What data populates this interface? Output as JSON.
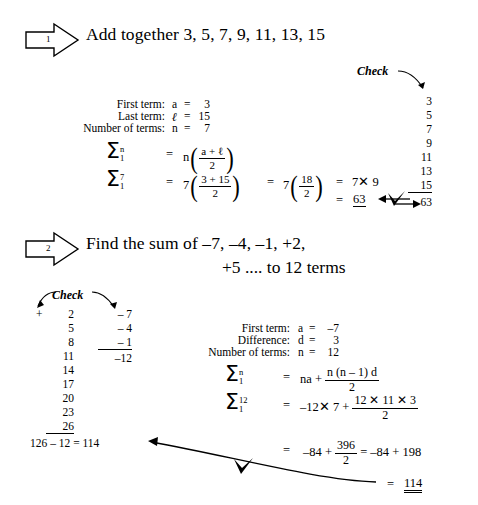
{
  "document": {
    "type": "worksheet",
    "subject": "Arithmetic progressions - sum of series"
  },
  "problems": [
    {
      "number": "1",
      "title": "Add together 3, 5, 7, 9, 11, 13, 15",
      "given": [
        {
          "label": "First term:",
          "symbol": "a",
          "eq": "=",
          "value": "3"
        },
        {
          "label": "Last term:",
          "symbol": "ℓ",
          "eq": "=",
          "value": "15"
        },
        {
          "label": "Number of terms:",
          "symbol": "n",
          "eq": "=",
          "value": "7"
        }
      ],
      "formula": {
        "sigma": "Σ",
        "upper_general": "n",
        "lower_general": "1",
        "upper_value": "7",
        "lower_value": "1",
        "general_lead": "n",
        "general_num": "a + ℓ",
        "general_den": "2",
        "sub_lead": "7",
        "sub_num": "3 + 15",
        "sub_den": "2",
        "step2_lead": "7",
        "step2_num": "18",
        "step2_den": "2",
        "step3": "7✕ 9",
        "equals": "=",
        "answer": "63"
      },
      "check": {
        "label": "Check",
        "terms": [
          "3",
          "5",
          "7",
          "9",
          "11",
          "13",
          "15"
        ],
        "total": "63"
      }
    },
    {
      "number": "2",
      "title": "Find the sum of –7, –4, –1, +2,",
      "title_cont": "+5 .... to 12 terms",
      "given": [
        {
          "label": "First term:",
          "symbol": "a",
          "eq": "=",
          "value": "–7"
        },
        {
          "label": "Difference:",
          "symbol": "d",
          "eq": "=",
          "value": "3"
        },
        {
          "label": "Number of terms:",
          "symbol": "n",
          "eq": "=",
          "value": "12"
        }
      ],
      "formula": {
        "sigma": "Σ",
        "upper_general": "n",
        "lower_general": "1",
        "upper_value": "12",
        "lower_value": "1",
        "general_lead": "na +",
        "general_num": "n (n – 1) d",
        "general_den": "2",
        "sub_lead": "–12✕ 7 +",
        "sub_num": "12 ✕ 11 ✕ 3",
        "sub_den": "2",
        "step2_lead": "–84 +",
        "step2_num": "396",
        "step2_den": "2",
        "step2_tail": "= –84 + 198",
        "equals": "=",
        "answer": "114"
      },
      "check": {
        "label": "Check",
        "pos_sign": "+",
        "pos_terms": [
          "2",
          "5",
          "8",
          "11",
          "14",
          "17",
          "20",
          "23",
          "26"
        ],
        "neg_terms": [
          "– 7",
          "– 4",
          "– 1"
        ],
        "neg_total": "–12",
        "result_line": "126 – 12 = 114"
      }
    }
  ],
  "colors": {
    "ink": "#000000",
    "paper": "#ffffff"
  }
}
